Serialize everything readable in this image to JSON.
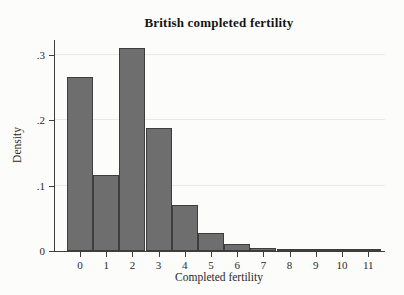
{
  "chart_data": {
    "type": "bar",
    "subtype": "histogram-discrete",
    "title": "British completed fertility",
    "xlabel": "Completed fertility",
    "ylabel": "Density",
    "categories": [
      0,
      1,
      2,
      3,
      4,
      5,
      6,
      7,
      8,
      9,
      10,
      11
    ],
    "values": [
      0.267,
      0.117,
      0.311,
      0.189,
      0.07,
      0.028,
      0.01,
      0.004,
      0.002,
      0.002,
      0.002,
      0.002
    ],
    "yticks": [
      0,
      0.1,
      0.2,
      0.3
    ],
    "ytick_labels": [
      "0",
      ".1",
      ".2",
      ".3"
    ],
    "xtick_labels": [
      "0",
      "1",
      "2",
      "3",
      "4",
      "5",
      "6",
      "7",
      "8",
      "9",
      "10",
      "11"
    ],
    "ylim": [
      0,
      0.323
    ],
    "xlim": [
      -0.95,
      11.65
    ],
    "grid": "horizontal",
    "legend": "none",
    "bar_color": "#6e6e6e",
    "bar_border_color": "#3d3d3d",
    "axis_color": "#3e3e3e",
    "gridline_color": "#e9e9e5",
    "background_color": "#fcfcfa"
  }
}
